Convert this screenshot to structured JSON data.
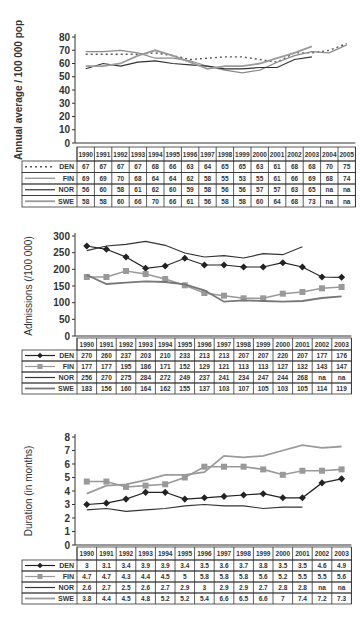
{
  "chart_data": [
    {
      "type": "line",
      "title": "",
      "ylabel": "Annual average / 100 000 pop",
      "xlabel": "",
      "ylim": [
        0,
        80
      ],
      "yticks": [
        0,
        10,
        20,
        30,
        40,
        50,
        60,
        70,
        80
      ],
      "grid": false,
      "legend_position": "table-left",
      "categories": [
        "1990",
        "1991",
        "1992",
        "1993",
        "1994",
        "1995",
        "1996",
        "1997",
        "1998",
        "1999",
        "2000",
        "2001",
        "2002",
        "2003",
        "2004",
        "2005"
      ],
      "series": [
        {
          "name": "DEN",
          "style": "dotted",
          "color": "#555555",
          "values": [
            67,
            67,
            67,
            67,
            68,
            66,
            63,
            64,
            65,
            65,
            63,
            61,
            68,
            68,
            70,
            75
          ]
        },
        {
          "name": "FIN",
          "style": "solid",
          "color": "#8a8a8a",
          "values": [
            69,
            69,
            70,
            68,
            64,
            64,
            62,
            58,
            55,
            53,
            55,
            61,
            66,
            69,
            68,
            74
          ]
        },
        {
          "name": "NOR",
          "style": "solid",
          "color": "#333333",
          "values": [
            56,
            60,
            58,
            61,
            62,
            60,
            59,
            58,
            56,
            56,
            57,
            57,
            63,
            65,
            "na",
            "na"
          ]
        },
        {
          "name": "SWE",
          "style": "solid-thick",
          "color": "#9a9a9a",
          "values": [
            58,
            58,
            60,
            66,
            70,
            66,
            61,
            56,
            58,
            58,
            60,
            64,
            68,
            73,
            "na",
            "na"
          ]
        }
      ]
    },
    {
      "type": "line",
      "title": "",
      "ylabel": "Admissions (/100 000)",
      "xlabel": "",
      "ylim": [
        0,
        300
      ],
      "yticks": [
        0,
        50,
        100,
        150,
        200,
        250,
        300
      ],
      "grid": false,
      "legend_position": "table-left",
      "categories": [
        "1990",
        "1991",
        "1992",
        "1993",
        "1994",
        "1995",
        "1996",
        "1997",
        "1998",
        "1999",
        "2000",
        "2001",
        "2002",
        "2003"
      ],
      "series": [
        {
          "name": "DEN",
          "style": "solid-diamond",
          "color": "#222222",
          "values": [
            270,
            260,
            237,
            203,
            210,
            233,
            213,
            213,
            207,
            207,
            220,
            207,
            177,
            176
          ]
        },
        {
          "name": "FIN",
          "style": "solid-square",
          "color": "#999999",
          "values": [
            177,
            177,
            195,
            186,
            171,
            152,
            129,
            121,
            113,
            113,
            127,
            132,
            143,
            147
          ]
        },
        {
          "name": "NOR",
          "style": "solid",
          "color": "#333333",
          "values": [
            256,
            270,
            275,
            284,
            272,
            249,
            237,
            241,
            234,
            247,
            244,
            268,
            "na",
            "na"
          ]
        },
        {
          "name": "SWE",
          "style": "solid-thick",
          "color": "#777777",
          "values": [
            183,
            156,
            160,
            164,
            162,
            155,
            137,
            103,
            107,
            105,
            103,
            105,
            114,
            119
          ]
        }
      ]
    },
    {
      "type": "line",
      "title": "",
      "ylabel": "Duration (in months)",
      "xlabel": "",
      "ylim": [
        0,
        8
      ],
      "yticks": [
        0,
        1,
        2,
        3,
        4,
        5,
        6,
        7,
        8
      ],
      "grid": false,
      "legend_position": "table-left",
      "categories": [
        "1990",
        "1991",
        "1992",
        "1993",
        "1994",
        "1995",
        "1996",
        "1997",
        "1998",
        "1999",
        "2000",
        "2001",
        "2002",
        "2003"
      ],
      "series": [
        {
          "name": "DEN",
          "style": "solid-diamond",
          "color": "#222222",
          "values": [
            3,
            3.1,
            3.4,
            3.9,
            3.9,
            3.4,
            3.5,
            3.6,
            3.7,
            3.8,
            3.5,
            3.5,
            4.6,
            4.9
          ]
        },
        {
          "name": "FIN",
          "style": "solid-square",
          "color": "#999999",
          "values": [
            4.7,
            4.7,
            4.3,
            4.4,
            4.5,
            5,
            5.8,
            5.8,
            5.8,
            5.6,
            5.2,
            5.5,
            5.5,
            5.6
          ]
        },
        {
          "name": "NOR",
          "style": "solid",
          "color": "#333333",
          "values": [
            2.6,
            2.7,
            2.5,
            2.6,
            2.7,
            2.9,
            3,
            2.9,
            2.9,
            2.7,
            2.8,
            2.8,
            "na",
            "na"
          ]
        },
        {
          "name": "SWE",
          "style": "solid-thick",
          "color": "#9a9a9a",
          "values": [
            3.8,
            4.4,
            4.5,
            4.8,
            5.2,
            5.2,
            5.4,
            6.6,
            6.5,
            6.6,
            7,
            7.4,
            7.2,
            7.3
          ]
        }
      ]
    }
  ]
}
